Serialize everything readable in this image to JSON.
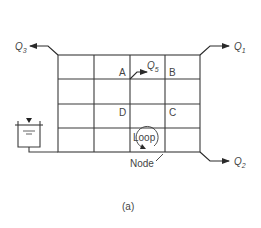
{
  "diagram": {
    "caption": "(a)",
    "nodes": {
      "A": "A",
      "B": "B",
      "C": "C",
      "D": "D"
    },
    "flows": [
      {
        "id": "Q1",
        "base": "Q",
        "sub": "1",
        "direction": "out",
        "location": "top-right"
      },
      {
        "id": "Q2",
        "base": "Q",
        "sub": "2",
        "direction": "out",
        "location": "bottom-right"
      },
      {
        "id": "Q3",
        "base": "Q",
        "sub": "3",
        "direction": "out",
        "location": "top-left"
      },
      {
        "id": "Q5",
        "base": "Q",
        "sub": "5",
        "direction": "out",
        "location": "interior-node"
      }
    ],
    "annotations": {
      "loop": "Loop",
      "node": "Node"
    },
    "grid": {
      "columns": 4,
      "rows": 4
    },
    "source": "reservoir-tank",
    "colors": {
      "line": "#3a3a3a",
      "text": "#444444"
    }
  }
}
